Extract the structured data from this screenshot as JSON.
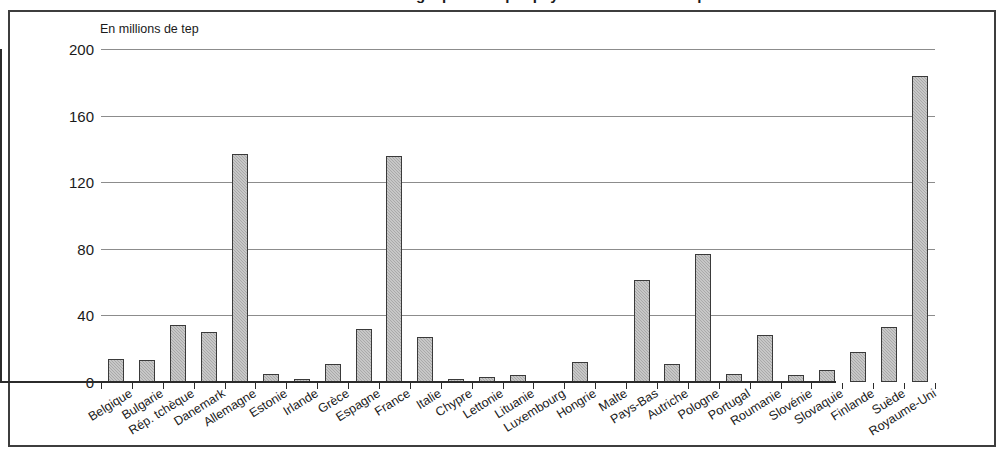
{
  "title_partial": "Consommation d'énergie primaire par pays dans l'Union européenne",
  "axis_note": "En millions de tep",
  "chart_data": {
    "type": "bar",
    "title": "",
    "subtitle": "En millions de tep",
    "xlabel": "",
    "ylabel": "En millions de tep",
    "ylim": [
      0,
      200
    ],
    "yticks": [
      0,
      40,
      80,
      120,
      160,
      200
    ],
    "grid": true,
    "legend": false,
    "bar_color": "#a9a9a9",
    "bar_border_color": "#3a3a3a",
    "categories": [
      "Belgique",
      "Bulgarie",
      "Rép. tchèque",
      "Danemark",
      "Allemagne",
      "Estonie",
      "Irlande",
      "Grèce",
      "Espagne",
      "France",
      "Italie",
      "Chypre",
      "Lettonie",
      "Lituanie",
      "Luxembourg",
      "Hongrie",
      "Malte",
      "Pays-Bas",
      "Autriche",
      "Pologne",
      "Portugal",
      "Roumanie",
      "Slovénie",
      "Slovaquie",
      "Finlande",
      "Suède",
      "Royaume-Uni"
    ],
    "values": [
      14,
      13,
      34,
      30,
      137,
      5,
      2,
      11,
      32,
      136,
      27,
      2,
      3,
      4,
      0.5,
      12,
      0.5,
      61,
      11,
      77,
      5,
      28,
      4,
      7,
      18,
      33,
      184
    ]
  }
}
